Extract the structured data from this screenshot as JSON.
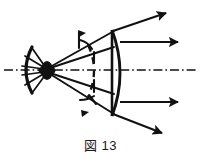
{
  "figure": {
    "caption": "図 13",
    "caption_label": "図",
    "caption_number": "13",
    "background_color": "#ffffff",
    "ink_color": "#111111",
    "width": 201,
    "height": 165
  },
  "diagram": {
    "type": "optical-ray-diagram",
    "title_text": "図 13",
    "optical_axis": {
      "name": "optical-axis",
      "style": "dash-dot",
      "y": 70,
      "x_start": 4,
      "x_end": 197,
      "color": "#111111"
    },
    "light_source": {
      "name": "light-source",
      "shape": "filled-ellipse",
      "cx": 47,
      "cy": 70,
      "rx": 6,
      "ry": 9,
      "color": "#111111"
    },
    "reflector": {
      "name": "concave-reflector",
      "shape": "arc",
      "opens": "right",
      "cx": 30,
      "cy": 70,
      "top_y": 48,
      "bottom_y": 92,
      "color": "#111111"
    },
    "lens": {
      "name": "plano-convex-lens",
      "flat_side": "left",
      "convex_side": "right",
      "flat_x": 112,
      "apex_x": 126,
      "top_y": 30,
      "bottom_y": 115,
      "color": "#111111"
    },
    "wavefront_arc": {
      "name": "dashed-wavefront-arc",
      "style": "dashed",
      "cx": 92,
      "top_y": 44,
      "bottom_y": 98,
      "color": "#111111"
    },
    "rays": [
      {
        "name": "ray-upper-outer",
        "angle_deg": -30,
        "output": "slanted-up-right"
      },
      {
        "name": "ray-upper-inner",
        "angle_deg": -17,
        "output": "horizontal-right"
      },
      {
        "name": "ray-axial",
        "angle_deg": 0,
        "output": "horizontal-right"
      },
      {
        "name": "ray-lower-inner",
        "angle_deg": 17,
        "output": "horizontal-right"
      },
      {
        "name": "ray-lower-outer",
        "angle_deg": 30,
        "output": "slanted-down-right"
      }
    ],
    "output_rays": [
      {
        "name": "output-ray-top-slant",
        "direction": "up-right",
        "arrowhead": true
      },
      {
        "name": "output-ray-upper",
        "direction": "right",
        "arrowhead": true
      },
      {
        "name": "output-ray-axis",
        "direction": "right",
        "arrowhead": true
      },
      {
        "name": "output-ray-lower",
        "direction": "right",
        "arrowhead": true
      },
      {
        "name": "output-ray-bottom-slant",
        "direction": "down-right",
        "arrowhead": true
      }
    ],
    "markers": [
      {
        "name": "wavefront-tick-upper",
        "type": "short-arc-tick"
      },
      {
        "name": "wavefront-tick-lower",
        "type": "short-arc-tick"
      },
      {
        "name": "direction-arrowhead-upper",
        "type": "solid-triangle"
      },
      {
        "name": "direction-arrowhead-lower",
        "type": "solid-triangle"
      }
    ]
  }
}
